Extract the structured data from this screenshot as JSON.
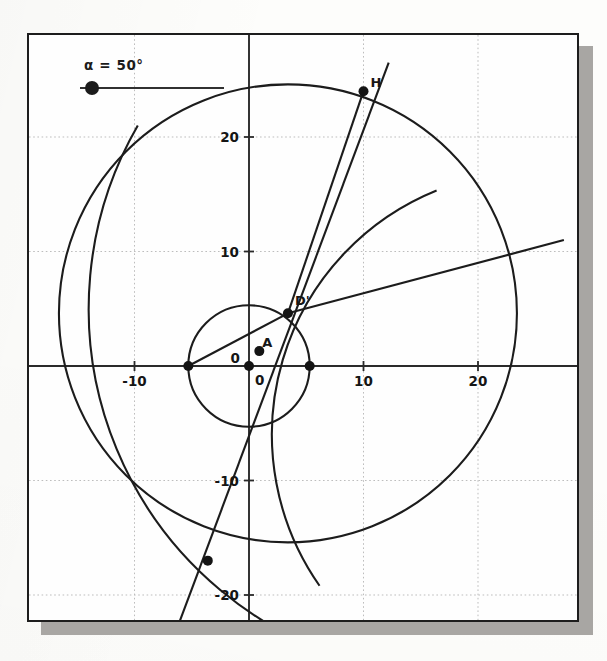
{
  "app": {
    "type": "geometry-applet",
    "background_color": "#fdfdfb",
    "panel_border_color": "#1d1d1d",
    "shadow_color": "#a8a6a3"
  },
  "slider": {
    "name": "alpha-slider",
    "label": "α = 50°",
    "variable": "α",
    "value": 50,
    "unit": "°",
    "knob_position_fraction": 0.05
  },
  "axes": {
    "x_label_values": [
      "-10",
      "0",
      "10",
      "20"
    ],
    "y_label_values": [
      "20",
      "10",
      "0",
      "-10",
      "-20"
    ],
    "origin_label": "0",
    "x_range": [
      -18.5,
      28.0
    ],
    "y_range": [
      -23.5,
      26.5
    ],
    "tick_step": 10,
    "gridline_step": 10,
    "grid": true,
    "grid_color": "#bdbdbd",
    "axis_color": "#2a2a2a"
  },
  "points": [
    {
      "name": "H",
      "label": "H",
      "x": 10.0,
      "y": 24.0,
      "label_dx": 7,
      "label_dy": -16
    },
    {
      "name": "Dp",
      "label": "D'",
      "x": 3.4,
      "y": 4.6,
      "label_dx": 7,
      "label_dy": -20
    },
    {
      "name": "A",
      "label": "A",
      "x": 0.9,
      "y": 1.3,
      "label_dx": 3,
      "label_dy": -16
    },
    {
      "name": "O",
      "label": "",
      "x": 0.0,
      "y": 0.0,
      "label_dx": 0,
      "label_dy": 0
    },
    {
      "name": "Cl",
      "label": "",
      "x": -5.3,
      "y": 0.0,
      "label_dx": 0,
      "label_dy": 0
    },
    {
      "name": "Cr",
      "label": "",
      "x": 5.3,
      "y": 0.0,
      "label_dx": 0,
      "label_dy": 0
    },
    {
      "name": "P",
      "label": "",
      "x": -3.6,
      "y": -17.0,
      "label_dx": 0,
      "label_dy": 0
    }
  ],
  "origin_axis_labels": {
    "y_zero": "0",
    "x_zero": "0"
  },
  "chart_data": {
    "type": "scatter",
    "title": "",
    "xlabel": "",
    "ylabel": "",
    "xlim": [
      -18.5,
      28.0
    ],
    "ylim": [
      -23.5,
      26.5
    ],
    "xticks": [
      -10,
      0,
      10,
      20
    ],
    "yticks": [
      -20,
      -10,
      0,
      10,
      20
    ],
    "grid": true,
    "legend": "none",
    "circles": [
      {
        "name": "large-circle",
        "cx": 3.4,
        "cy": 4.6,
        "r": 20.0,
        "stroke": "#1c1c1c"
      },
      {
        "name": "small-circle",
        "cx": 0.0,
        "cy": 0.0,
        "r": 5.3,
        "stroke": "#1c1c1c"
      }
    ],
    "arcs": [
      {
        "name": "lower-left-arc",
        "cx": 18.0,
        "cy": 5.0,
        "r": 32.0,
        "stroke": "#1c1c1c",
        "start_deg": 150,
        "end_deg": 255
      },
      {
        "name": "steep-conic-arc",
        "cx": 25.0,
        "cy": -6.0,
        "r": 23.0,
        "stroke": "#1c1c1c",
        "start_deg": 112,
        "end_deg": 215
      }
    ],
    "lines": [
      {
        "name": "line-through-H",
        "x1": -6.5,
        "y1": -23.5,
        "x2": 12.2,
        "y2": 26.5,
        "stroke": "#1c1c1c"
      },
      {
        "name": "ray-through-Dprime",
        "x1": 3.4,
        "y1": 4.6,
        "x2": 27.5,
        "y2": 11.0,
        "stroke": "#1c1c1c"
      },
      {
        "name": "segment-O-Dprime",
        "x1": -5.3,
        "y1": 0.0,
        "x2": 3.4,
        "y2": 4.6,
        "stroke": "#1c1c1c"
      },
      {
        "name": "segment-Dprime-H",
        "x1": 3.4,
        "y1": 4.6,
        "x2": 10.0,
        "y2": 24.0,
        "stroke": "#1c1c1c"
      }
    ]
  }
}
